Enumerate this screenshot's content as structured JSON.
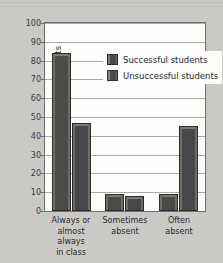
{
  "chart_data": {
    "type": "bar",
    "title": "",
    "xlabel": "",
    "ylabel": "Percent of students",
    "ylim": [
      0,
      100
    ],
    "ytick_step": 10,
    "yticks": [
      100,
      90,
      80,
      70,
      60,
      50,
      40,
      30,
      20,
      10,
      0
    ],
    "grid": true,
    "legend_position": "inside-top-center",
    "categories": [
      "Always or almost always in class",
      "Sometimes absent",
      "Often absent"
    ],
    "category_lines": [
      [
        "Always or",
        "almost always",
        "in class"
      ],
      [
        "Sometimes",
        "absent"
      ],
      [
        "Often",
        "absent"
      ]
    ],
    "series": [
      {
        "name": "Successful students",
        "color": "#4a4a48",
        "values": [
          84,
          9,
          9
        ]
      },
      {
        "name": "Unsuccessful students",
        "color": "#4b4b50",
        "values": [
          47,
          8,
          45
        ]
      }
    ]
  },
  "legend": {
    "items": [
      {
        "label": "Successful students"
      },
      {
        "label": "Unsuccessful students"
      }
    ]
  },
  "colors": {
    "page_background": "#c9c9c5",
    "plot_background": "#fdfdfc",
    "axis": "#6f6f6c",
    "gridline": "#a9a9a5",
    "text": "#2a2a28"
  }
}
